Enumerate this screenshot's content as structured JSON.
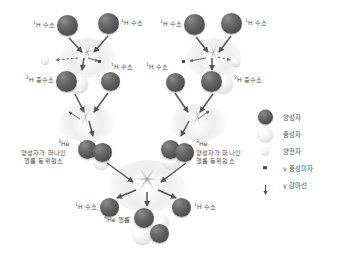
{
  "diagram": {
    "background": "#ffffff",
    "proton_color": "#5a5a5a",
    "neutron_color": "#eeeeee",
    "positron_color": "#e8e8e8",
    "neutrino_color": "#4a4a4a",
    "label_color": "#4a4a4a"
  },
  "labels": {
    "hydrogen_sup": "1",
    "hydrogen": "H 수소",
    "deuterium_sup": "2",
    "deuterium": "H 중수소",
    "helium3_sup": "3",
    "helium3_symbol": "He",
    "helium3_desc_line1": "양성자가 하나인",
    "helium3_desc_line2": "헬륨 동위원소",
    "helium4_sup": "4",
    "helium4": "He 헬륨"
  },
  "left_branch": {
    "step1_left_label": "¹H 수소",
    "step1_right_label": "¹H 수소",
    "step2_left_label": "²H 중수소",
    "step2_right_label": "¹H 수소",
    "step3_label": "³He"
  },
  "right_branch": {
    "step1_left_label": "¹H 수소",
    "step1_right_label": "¹H 수소",
    "step2_left_label": "¹H 수소",
    "step2_right_label": "²H 중수소",
    "step3_label": "³He"
  },
  "bottom": {
    "left_label": "¹H 수소",
    "right_label": "¹H 수소",
    "product_label": "⁴He 헬륨"
  },
  "legend": {
    "items": [
      {
        "icon": "proton-sphere-icon",
        "label": "양성자"
      },
      {
        "icon": "neutron-sphere-icon",
        "label": "중성자"
      },
      {
        "icon": "positron-sphere-icon",
        "label": "양전자"
      },
      {
        "icon": "neutrino-dot-icon",
        "label": "ν 중성미자"
      },
      {
        "icon": "gamma-arrow-icon",
        "label": "γ 감마선"
      }
    ]
  }
}
